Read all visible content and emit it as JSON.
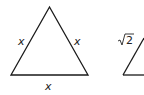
{
  "figure": {
    "left_triangle": {
      "type": "equilateral",
      "side_labels": {
        "left": "x",
        "right": "x",
        "bottom": "x"
      }
    },
    "right_triangle": {
      "type": "partial",
      "side_labels": {
        "left": "√2"
      }
    },
    "colors": {
      "stroke": "#1a1a1a",
      "label": "#222222",
      "background": "#ffffff"
    }
  }
}
